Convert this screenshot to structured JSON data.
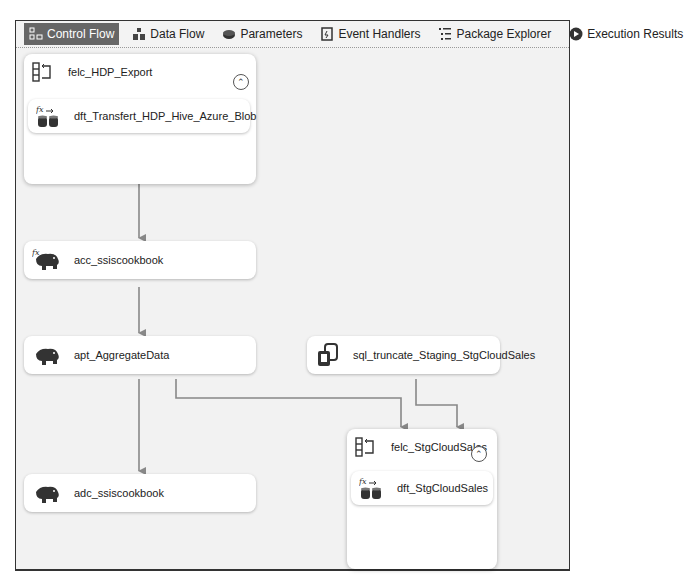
{
  "tabs": [
    {
      "label": "Control Flow",
      "icon": "control-flow-icon",
      "active": true
    },
    {
      "label": "Data Flow",
      "icon": "data-flow-icon",
      "active": false
    },
    {
      "label": "Parameters",
      "icon": "parameters-icon",
      "active": false
    },
    {
      "label": "Event Handlers",
      "icon": "event-handlers-icon",
      "active": false
    },
    {
      "label": "Package Explorer",
      "icon": "package-explorer-icon",
      "active": false
    },
    {
      "label": "Execution Results",
      "icon": "execution-results-icon",
      "active": false
    }
  ],
  "containers": [
    {
      "label": "felc_HDP_Export",
      "icon": "foreach-loop-container-icon",
      "collapse": "^",
      "children": [
        {
          "label": "dft_Transfert_HDP_Hive_Azure_Blob",
          "icon": "data-flow-task-icon",
          "has_expression": true
        }
      ]
    },
    {
      "label": "felc_StgCloudSales",
      "icon": "foreach-loop-container-icon",
      "collapse": "^",
      "children": [
        {
          "label": "dft_StgCloudSales",
          "icon": "data-flow-task-icon",
          "has_expression": true
        }
      ]
    }
  ],
  "tasks": [
    {
      "label": "acc_ssiscookbook",
      "icon": "hadoop-elephant-icon",
      "has_expression": true
    },
    {
      "label": "apt_AggregateData",
      "icon": "hadoop-elephant-icon",
      "has_expression": false
    },
    {
      "label": "sql_truncate_Staging_StgCloudSales",
      "icon": "execute-sql-task-icon",
      "has_expression": false
    },
    {
      "label": "adc_ssiscookbook",
      "icon": "hadoop-elephant-icon",
      "has_expression": false
    }
  ],
  "colors": {
    "active_tab_bg": "#666666",
    "canvas_bg": "#f2f2f2",
    "connector": "#888888"
  }
}
